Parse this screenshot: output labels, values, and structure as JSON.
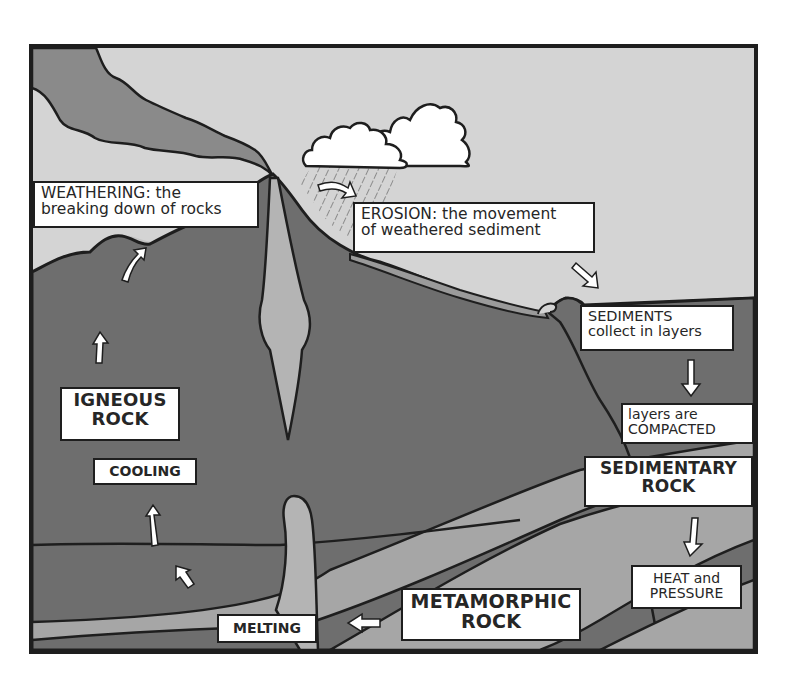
{
  "diagram": {
    "colors": {
      "sky": "#d4d4d4",
      "rock_dark": "#6e6e6e",
      "smoke": "#8a8a8a",
      "magma_light": "#b4b4b4",
      "band_light": "#a6a6a6",
      "outline": "#1e1e1e",
      "label_bg": "#ffffff"
    },
    "labels": {
      "weathering": {
        "line1": "WEATHERING: the",
        "line2": "breaking down of rocks"
      },
      "erosion": {
        "line1": "EROSION: the movement",
        "line2": "of weathered sediment"
      },
      "sediments": {
        "line1": "SEDIMENTS",
        "line2": "collect in layers"
      },
      "compacted": {
        "line1": "layers are",
        "line2": "COMPACTED"
      },
      "sedimentary_rock": {
        "line1": "SEDIMENTARY",
        "line2": "ROCK"
      },
      "heat_pressure": {
        "line1": "HEAT and",
        "line2": "PRESSURE"
      },
      "metamorphic_rock": {
        "line1": "METAMORPHIC",
        "line2": "ROCK"
      },
      "melting": {
        "line1": "MELTING"
      },
      "cooling": {
        "line1": "COOLING"
      },
      "igneous_rock": {
        "line1": "IGNEOUS",
        "line2": "ROCK"
      }
    },
    "icons": [
      "volcano",
      "smoke-plume",
      "rain-cloud",
      "rain",
      "ocean",
      "magma-chamber",
      "cycle-arrows"
    ]
  }
}
